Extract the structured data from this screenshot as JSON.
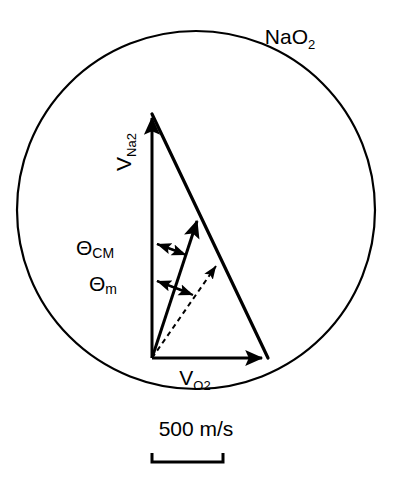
{
  "figure": {
    "type": "newton-diagram",
    "background_color": "#ffffff",
    "stroke_color": "#000000"
  },
  "circle": {
    "name": "reaction-circle",
    "center_x": 196,
    "center_y": 210,
    "radius": 179,
    "stroke_width": 2.2
  },
  "labels": {
    "product_species": {
      "base": "NaO",
      "sub": "2",
      "x": 290,
      "y": 44
    },
    "vector_vertical": {
      "base": "V",
      "sub": "Na2",
      "x": 131,
      "y": 152,
      "rotation": -90
    },
    "vector_horizontal": {
      "base": "V",
      "sub": "O",
      "sub2": "2",
      "x": 195,
      "y": 385
    },
    "angle_cm": {
      "base": "Θ",
      "sub": "CM",
      "x": 95,
      "y": 255
    },
    "angle_m": {
      "base": "Θ",
      "sub": "m",
      "x": 103,
      "y": 291
    },
    "scale": {
      "text": "500 m/s",
      "x": 196,
      "y": 436
    }
  },
  "geometry": {
    "origin": {
      "x": 152,
      "y": 358
    },
    "v_na2_tip": {
      "x": 152,
      "y": 112
    },
    "v_o2_tip": {
      "x": 268,
      "y": 358
    },
    "hypotenuse": {
      "from_x": 152,
      "from_y": 112,
      "to_x": 268,
      "to_y": 358
    },
    "cm_vector_tip": {
      "x": 199,
      "y": 216
    },
    "m_vector_tip": {
      "x": 219,
      "y": 261
    },
    "stroke_width_vectors": 3.2,
    "stroke_width_thin": 2.0,
    "dash_pattern": "5,4"
  },
  "angle_markers": {
    "cm": {
      "left_arrow": {
        "x1": 183,
        "y1": 253,
        "x2": 155,
        "y2": 244
      },
      "right_arrow": {
        "x1": 155,
        "y1": 244,
        "x2": 187,
        "y2": 256
      }
    },
    "m": {
      "left_arrow": {
        "x1": 190,
        "y1": 293,
        "x2": 155,
        "y2": 281
      },
      "right_arrow": {
        "x1": 155,
        "y1": 281,
        "x2": 194,
        "y2": 296
      }
    }
  },
  "scale_bar": {
    "name": "scale-bar",
    "x_start": 152,
    "x_end": 223,
    "y": 462,
    "tick_height": 9,
    "stroke_width": 3
  }
}
